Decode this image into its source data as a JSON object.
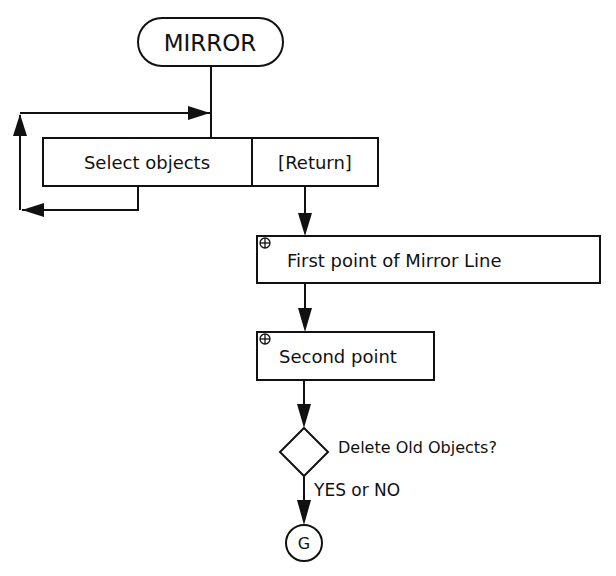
{
  "diagram": {
    "title": "MIRROR",
    "colors": {
      "stroke": "#111111",
      "background": "#ffffff"
    },
    "nodes": {
      "start": {
        "label": "MIRROR",
        "shape": "rounded-pill"
      },
      "select": {
        "label": "Select objects",
        "shape": "rectangle"
      },
      "return": {
        "label": "[Return]",
        "shape": "rectangle"
      },
      "first_point": {
        "label": "First point of Mirror Line",
        "shape": "rectangle",
        "icon": "crosshair-point-icon"
      },
      "second_point": {
        "label": "Second point",
        "shape": "rectangle",
        "icon": "crosshair-point-icon"
      },
      "decision": {
        "label": "Delete Old Objects?",
        "shape": "diamond"
      },
      "decision_answer": {
        "label": "YES or NO"
      },
      "end": {
        "label": "G",
        "shape": "circle"
      }
    },
    "edges": [
      {
        "from": "start",
        "to": "select"
      },
      {
        "from": "select",
        "to": "select",
        "type": "loop"
      },
      {
        "from": "return",
        "to": "first_point"
      },
      {
        "from": "first_point",
        "to": "second_point"
      },
      {
        "from": "second_point",
        "to": "decision"
      },
      {
        "from": "decision",
        "to": "end",
        "label": "YES or NO"
      }
    ]
  }
}
